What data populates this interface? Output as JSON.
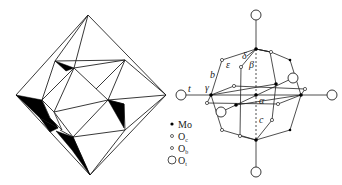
{
  "figure": {
    "left_panel": {
      "description": "Polyhedral model of cluster (octahedral framework with shaded triangular faces)"
    },
    "right_panel": {
      "axis_labels": {
        "t": "t",
        "b": "b",
        "c": "c",
        "alpha": "α",
        "beta": "β",
        "gamma": "γ",
        "delta": "δ",
        "epsilon": "ε"
      },
      "legend": [
        {
          "symbol": "filled-dot",
          "label": "Mo",
          "sub": ""
        },
        {
          "symbol": "small-circle",
          "label": "O",
          "sub": "c"
        },
        {
          "symbol": "small-circle",
          "label": "O",
          "sub": "b"
        },
        {
          "symbol": "large-circle",
          "label": "O",
          "sub": "t"
        }
      ]
    },
    "colors": {
      "line": "#222222",
      "fill_dark": "#000000",
      "background": "#ffffff"
    }
  }
}
